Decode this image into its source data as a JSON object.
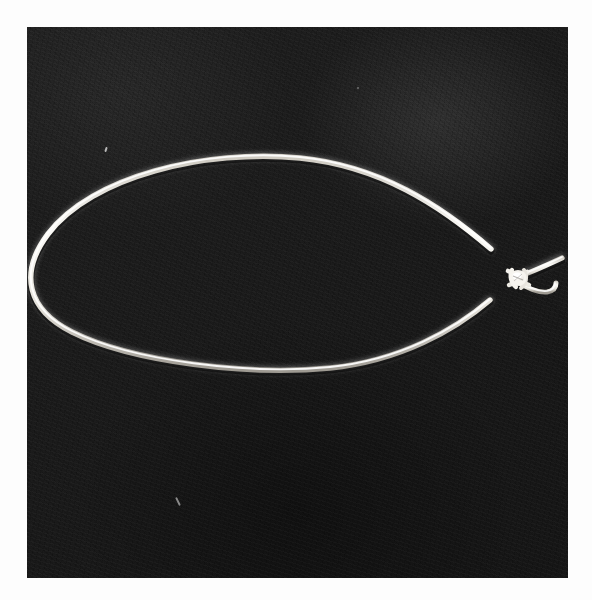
{
  "page": {
    "background_color": "#fdfdfd",
    "width": 592,
    "height": 600,
    "caption": ""
  },
  "photo": {
    "label": "Photograph of a white cord tied into a single loop",
    "subject": "string-loop-with-knot",
    "frame": {
      "left": 27,
      "top": 27,
      "width": 541,
      "height": 551
    },
    "background_color": "#1b1b1b",
    "cord_color": "#f2f0ea",
    "cord_shadow_color": "#6e6a62",
    "cord_thickness_px": 5,
    "media": "black-and-white photographic print",
    "notes": "White cotton cord laid on dark fabric, formed into a long closed loop with a small overhand knot at the right joining the two ends; two short tails extend past the knot.",
    "elements": {
      "loop_label": "cord loop",
      "knot_label": "overhand knot",
      "tail_upper_label": "upper free end",
      "tail_lower_label": "lower free end"
    },
    "geometry": {
      "loop_path": "M 491 249 C 440 205, 380 166, 300 158 C 205 149, 92 176, 48 234 C 18 274, 28 310, 72 332 C 132 362, 250 376, 330 368 C 400 361, 455 330, 490 300",
      "tail_upper_path": "M 518 277 L 561 258",
      "tail_lower_path": "M 518 281 C 530 286, 540 292, 548 291 C 553 290, 555 287, 555 284",
      "knot_center": [
        518,
        278
      ],
      "knot_radius": 11,
      "leftmost_point": [
        44,
        262
      ],
      "topmost_point": [
        300,
        158
      ],
      "bottommost_point": [
        330,
        369
      ],
      "rightmost_point": [
        561,
        258
      ]
    }
  }
}
